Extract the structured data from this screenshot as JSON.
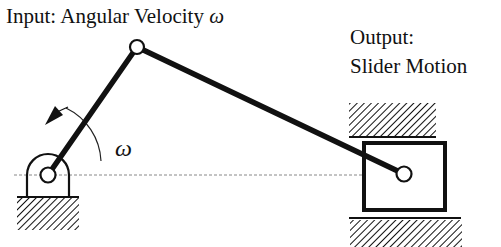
{
  "diagram": {
    "labels": {
      "input": "Input: Angular Velocity",
      "input_symbol": "ω",
      "output_line1": "Output:",
      "output_line2": "Slider Motion",
      "crank_angle_symbol": "ω"
    },
    "components": {
      "ground_pivot": {
        "cx": 48,
        "cy": 175,
        "r": 7
      },
      "crank_joint": {
        "cx": 137,
        "cy": 47,
        "r": 7
      },
      "slider_pin": {
        "cx": 404,
        "cy": 174,
        "r": 7
      },
      "slider_block": {
        "x": 364,
        "y": 143,
        "w": 81,
        "h": 67
      },
      "centerline_y": 175
    },
    "colors": {
      "stroke": "#111111",
      "background": "#ffffff",
      "centerline": "#888888"
    }
  }
}
